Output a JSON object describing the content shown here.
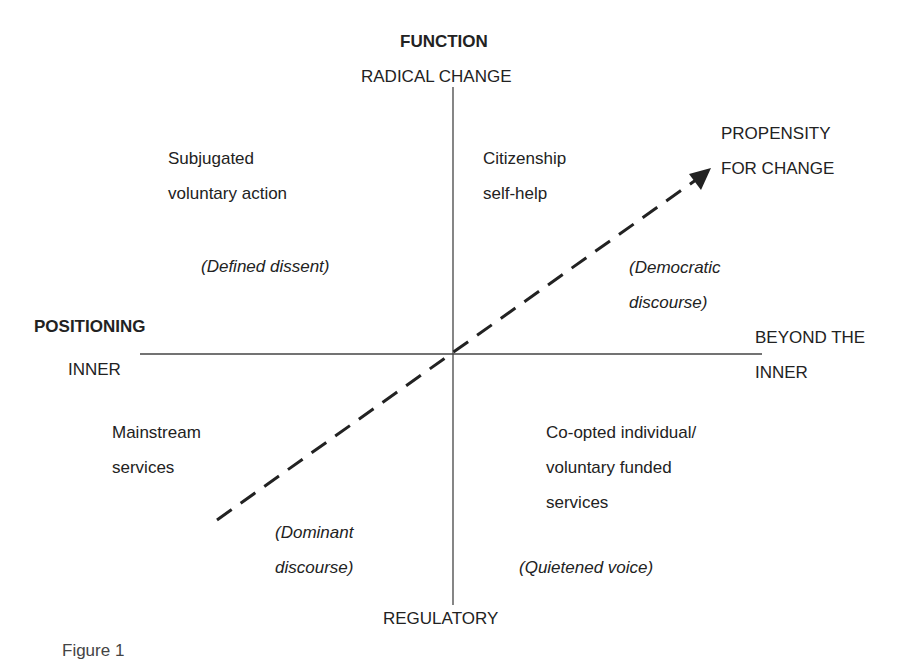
{
  "axes": {
    "vertical": {
      "title": "FUNCTION",
      "top_label": "RADICAL CHANGE",
      "bottom_label": "REGULATORY"
    },
    "horizontal": {
      "title": "POSITIONING",
      "left_label": "INNER",
      "right_label": "BEYOND THE\nINNER"
    }
  },
  "arrow": {
    "label": "PROPENSITY\nFOR CHANGE",
    "style": "dashed"
  },
  "quadrants": {
    "top_left": {
      "label": "Subjugated\nvoluntary action",
      "discourse": "(Defined dissent)"
    },
    "top_right": {
      "label": "Citizenship\nself-help",
      "discourse": "(Democratic\ndiscourse)"
    },
    "bottom_left": {
      "label": "Mainstream\nservices",
      "discourse": "(Dominant\ndiscourse)"
    },
    "bottom_right": {
      "label": "Co-opted individual/\nvoluntary funded\nservices",
      "discourse": "(Quietened voice)"
    }
  },
  "caption": "Figure 1",
  "colors": {
    "line": "#333333",
    "text": "#222222",
    "background": "#ffffff"
  }
}
